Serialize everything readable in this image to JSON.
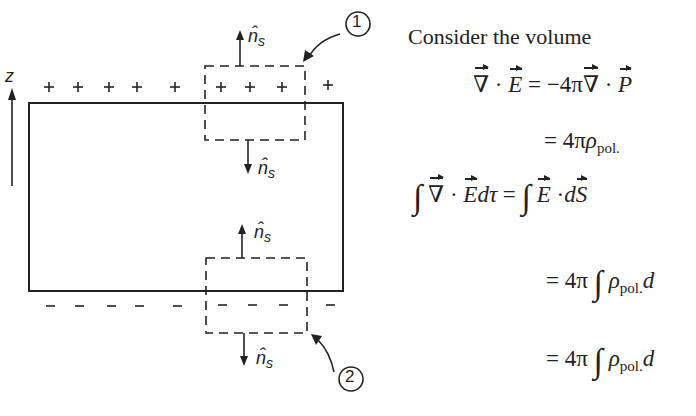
{
  "figure": {
    "axis_label": "z",
    "normal_label": "n̂s",
    "normal_hat": "n̂",
    "normal_sub": "s",
    "plus_signs": [
      "+",
      "+",
      "+",
      "+",
      "+",
      "+",
      "+",
      "+",
      "+"
    ],
    "minus_signs": [
      "–",
      "–",
      "–",
      "–",
      "–",
      "–",
      "–",
      "–",
      "–"
    ],
    "callouts": [
      "1",
      "2"
    ]
  },
  "text": {
    "intro": "Consider the volume",
    "eq1_lhs_nabla": "∇",
    "eq1_lhs_dot": "·",
    "eq1_lhs_E": "E",
    "eq1_equals": "=",
    "eq1_rhs_coef": "−4π",
    "eq1_rhs_nabla": "∇",
    "eq1_rhs_dot": "·",
    "eq1_rhs_P": "P",
    "eq2_equals": "=",
    "eq2_coef": "4π",
    "eq2_rho": "ρ",
    "eq2_sub": "pol.",
    "eq3_int": "∫",
    "eq3_nabla": "∇",
    "eq3_dot": "·",
    "eq3_E": "E",
    "eq3_dtau": "dτ",
    "eq3_equals": "=",
    "eq3_int2": "∫",
    "eq3_E2": "E",
    "eq3_dot2": "·",
    "eq3_d": "d",
    "eq3_S": "S",
    "eq4_equals": "=",
    "eq4_coef": "4π",
    "eq4_int": "∫",
    "eq4_rho": "ρ",
    "eq4_sub": "pol.",
    "eq4_tail": "d",
    "eq5_equals": "=",
    "eq5_coef": "4π",
    "eq5_int": "∫",
    "eq5_rho": "ρ",
    "eq5_sub": "pol.",
    "eq5_tail": "d"
  }
}
